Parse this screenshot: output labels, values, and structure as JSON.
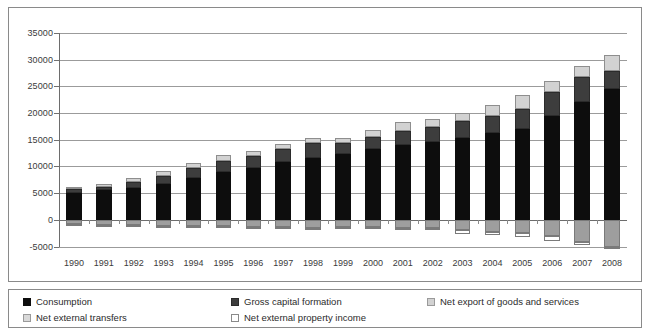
{
  "chart_data": {
    "type": "bar",
    "stacked": true,
    "title": "",
    "subtitle": "",
    "xlabel": "",
    "ylabel": "",
    "ylim": [
      -5000,
      35000
    ],
    "ytick_values": [
      -5000,
      0,
      5000,
      10000,
      15000,
      20000,
      25000,
      30000,
      35000
    ],
    "ytick_labels": [
      "-5000",
      "0",
      "5000",
      "10000",
      "15000",
      "20000",
      "25000",
      "30000",
      "35000"
    ],
    "grid": true,
    "legend_position": "bottom",
    "categories": [
      "1990",
      "1991",
      "1992",
      "1993",
      "1994",
      "1995",
      "1996",
      "1997",
      "1998",
      "1999",
      "2000",
      "2001",
      "2002",
      "2003",
      "2004",
      "2005",
      "2006",
      "2007",
      "2008"
    ],
    "series": [
      {
        "name": "Consumption",
        "color": "#0d0d0d",
        "values": [
          5100,
          5500,
          6000,
          6800,
          7900,
          9000,
          9700,
          10800,
          11600,
          12300,
          13300,
          14000,
          14600,
          15400,
          16200,
          17100,
          19500,
          22100,
          24500
        ]
      },
      {
        "name": "Gross capital formation",
        "color": "#3d3d3d",
        "values": [
          600,
          700,
          1100,
          1500,
          1900,
          2100,
          2200,
          2500,
          2800,
          2100,
          2200,
          2600,
          2700,
          3100,
          3200,
          3600,
          4400,
          4600,
          3300
        ]
      },
      {
        "name": "Net export of goods and services",
        "color": "#d2d2d2",
        "values": [
          400,
          500,
          700,
          800,
          800,
          1100,
          1000,
          900,
          1000,
          1000,
          1400,
          1700,
          1600,
          1600,
          2100,
          2700,
          2100,
          2100,
          3100
        ]
      },
      {
        "name": "Net external transfers",
        "color": "#9e9e9e",
        "values": [
          -800,
          -900,
          -1000,
          -1100,
          -1200,
          -1200,
          -1300,
          -1300,
          -1500,
          -1400,
          -1400,
          -1500,
          -1600,
          -1900,
          -2200,
          -2500,
          -3100,
          -4200,
          -5000
        ]
      },
      {
        "name": "Net external property income",
        "color": "#ffffff",
        "values": [
          -100,
          -100,
          -150,
          -150,
          -200,
          -200,
          -200,
          -250,
          -250,
          -250,
          -300,
          -400,
          -400,
          -700,
          -700,
          -800,
          -800,
          -500,
          -500
        ]
      }
    ]
  },
  "legend": {
    "items": [
      {
        "label": "Consumption",
        "swatch": "consumption"
      },
      {
        "label": "Gross capital formation",
        "swatch": "gcf"
      },
      {
        "label": "Net export of goods and services",
        "swatch": "export"
      },
      {
        "label": "Net external transfers",
        "swatch": "transfers"
      },
      {
        "label": "Net external property income",
        "swatch": "property"
      }
    ]
  },
  "colors": {
    "consumption": "#0d0d0d",
    "gross_capital_formation": "#3d3d3d",
    "net_export": "#d2d2d2",
    "net_external_transfers": "#9e9e9e",
    "net_external_property_income": "#ffffff",
    "gridline": "#9b9b9b",
    "border": "#8a8a8a",
    "text": "#3b3b3b"
  }
}
